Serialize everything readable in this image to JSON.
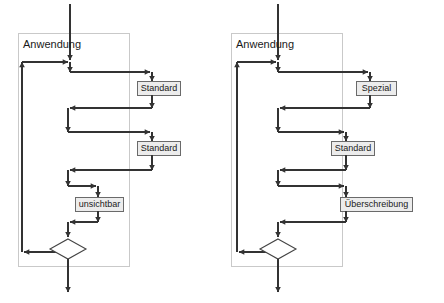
{
  "page": {
    "background_color": "#ffffff"
  },
  "style": {
    "line_color": "#333333",
    "container_border_color": "#c9c9c9",
    "node_fill_color": "#ececec",
    "node_border_color": "#6a6a6a",
    "diamond_fill_color": "#ffffff",
    "text_color": "#1a1a1a"
  },
  "diagrams": [
    {
      "id": "left",
      "container_title": "Anwendung",
      "nodes": [
        {
          "id": "l-n1",
          "label": "Standard"
        },
        {
          "id": "l-n2",
          "label": "Standard"
        },
        {
          "id": "l-n3",
          "label": "unsichtbar"
        }
      ],
      "decision": {
        "id": "l-d1",
        "label": ""
      }
    },
    {
      "id": "right",
      "container_title": "Anwendung",
      "nodes": [
        {
          "id": "r-n1",
          "label": "Spezial"
        },
        {
          "id": "r-n2",
          "label": "Standard"
        },
        {
          "id": "r-n3",
          "label": "Überschreibung"
        }
      ],
      "decision": {
        "id": "r-d1",
        "label": ""
      }
    }
  ]
}
